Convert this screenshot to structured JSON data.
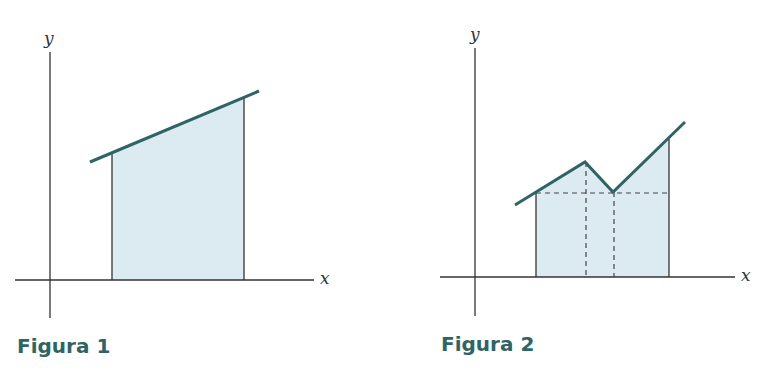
{
  "figures": [
    {
      "caption": "Figura 1",
      "x_axis_label": "x",
      "y_axis_label": "y",
      "description": "Area under a straight sloped line between two vertical bounds, shaded"
    },
    {
      "caption": "Figura 2",
      "x_axis_label": "x",
      "y_axis_label": "y",
      "description": "Area under a piecewise-linear curve (peak then dip then rise) split into three strips by dashed lines, shaded"
    }
  ],
  "colors": {
    "curve": "#2f6466",
    "fill": "#dcebf1",
    "axis": "#333333",
    "caption": "#2f6466"
  }
}
